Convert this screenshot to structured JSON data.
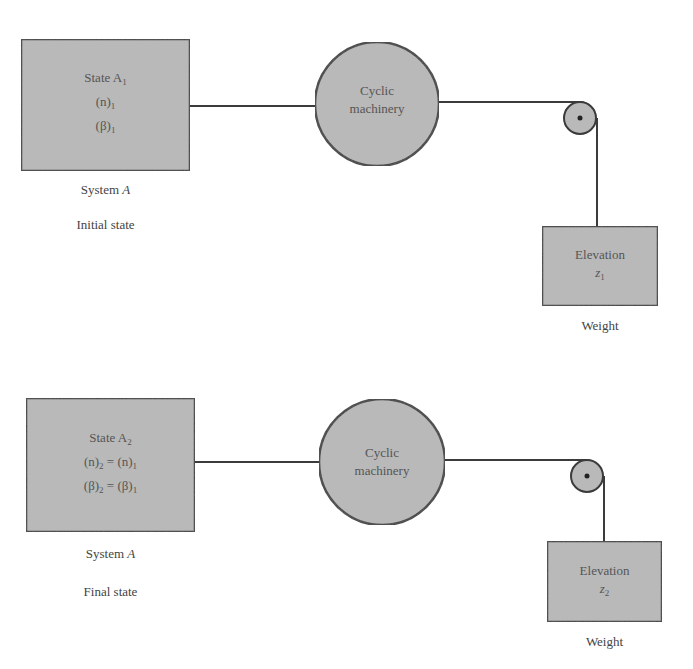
{
  "diagram": {
    "type": "thermodynamic process schematic",
    "colors": {
      "fill": "#b9b9b9",
      "stroke": "#3b3b3b",
      "background": "#ffffff"
    },
    "panels": [
      {
        "id": "initial",
        "system_box": {
          "title": "State A",
          "title_sub": "1",
          "lines": [
            {
              "text": "(n)",
              "sub": "1",
              "eq": "",
              "rhs": "",
              "rhs_sub": ""
            },
            {
              "text": "(β)",
              "sub": "1",
              "eq": "",
              "rhs": "",
              "rhs_sub": ""
            }
          ]
        },
        "system_label": "System",
        "system_label_var": "A",
        "state_label": "Initial state",
        "machinery_label_1": "Cyclic",
        "machinery_label_2": "machinery",
        "weight_box": {
          "title": "Elevation",
          "var": "z",
          "var_sub": "1"
        },
        "weight_label": "Weight"
      },
      {
        "id": "final",
        "system_box": {
          "title": "State A",
          "title_sub": "2",
          "lines": [
            {
              "text": "(n)",
              "sub": "2",
              "eq": " = ",
              "rhs": "(n)",
              "rhs_sub": "1"
            },
            {
              "text": "(β)",
              "sub": "2",
              "eq": " = ",
              "rhs": "(β)",
              "rhs_sub": "1"
            }
          ]
        },
        "system_label": "System",
        "system_label_var": "A",
        "state_label": "Final state",
        "machinery_label_1": "Cyclic",
        "machinery_label_2": "machinery",
        "weight_box": {
          "title": "Elevation",
          "var": "z",
          "var_sub": "2"
        },
        "weight_label": "Weight"
      }
    ]
  }
}
